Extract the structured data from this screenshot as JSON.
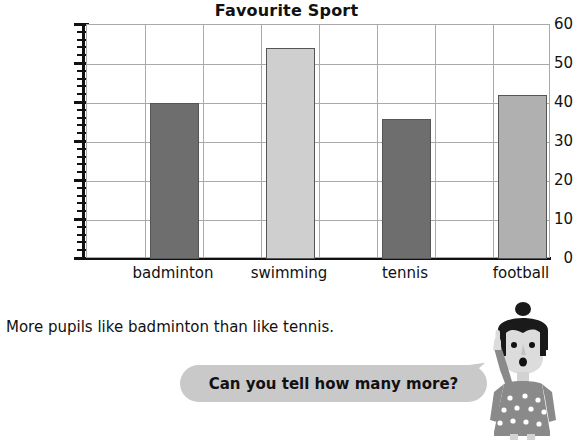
{
  "chart_data": {
    "type": "bar",
    "title": "Favourite Sport",
    "xlabel": "",
    "ylabel": "",
    "categories": [
      "badminton",
      "swimming",
      "tennis",
      "football"
    ],
    "values": [
      40,
      54,
      36,
      42
    ],
    "bar_colors": [
      "#6e6e6e",
      "#cfcfcf",
      "#6e6e6e",
      "#b0b0b0"
    ],
    "bar_border_color": "#555555",
    "ylim": [
      0,
      60
    ],
    "y_major_ticks": [
      0,
      10,
      20,
      30,
      40,
      50,
      60
    ],
    "y_minor_tick_step": 2,
    "y_tick_labels": [
      "0",
      "10",
      "20",
      "30",
      "40",
      "50",
      "60"
    ],
    "grid": true,
    "gridline_color": "#aaaaaa",
    "legend": "none"
  },
  "worksheet": {
    "statement": "More pupils like badminton than like tennis.",
    "speech_bubble": {
      "text": "Can you tell how many more?",
      "fill_color": "#c9c9c9"
    },
    "character": {
      "name": "girl-pointing",
      "hair_color": "#1a1a1a",
      "skin_color": "#d8d8d8",
      "dress_color": "#8a8a8a",
      "dot_color": "#ffffff"
    }
  }
}
